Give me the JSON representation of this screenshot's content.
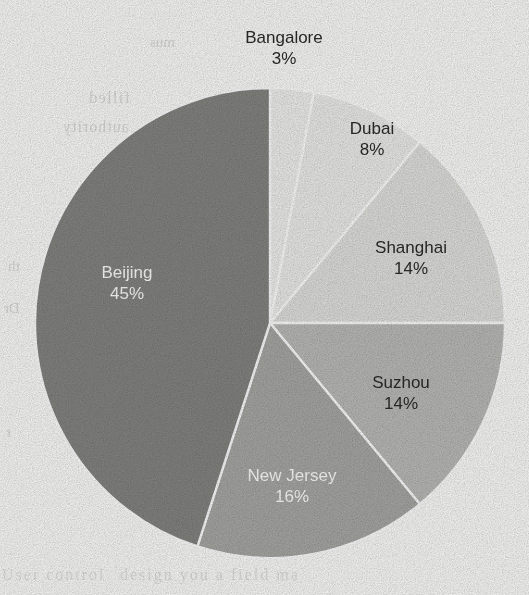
{
  "figure": {
    "background_color": "#fdfdfc",
    "stroke_color": "#ffffff"
  },
  "chart_data": {
    "type": "pie",
    "title": "",
    "subtitle": "",
    "xlabel": "",
    "ylabel": "",
    "legend_position": "none",
    "grid": false,
    "start_angle_deg": 0,
    "direction": "clockwise",
    "units": "percent",
    "categories": [
      "Bangalore",
      "Dubai",
      "Shanghai",
      "Suzhou",
      "New Jersey",
      "Beijing"
    ],
    "values": [
      3,
      8,
      14,
      14,
      16,
      45
    ],
    "labels": [
      "3%",
      "8%",
      "14%",
      "14%",
      "16%",
      "45%"
    ],
    "colors": [
      "#f1f1ef",
      "#eeeeec",
      "#e2e2df",
      "#bcbcb9",
      "#a9a9a6",
      "#858582"
    ],
    "slices": [
      {
        "name": "Bangalore",
        "value": 3,
        "label": "3%",
        "color": "#f1f1ef",
        "start_deg": 0,
        "end_deg": 10.8,
        "label_color": "#2b2b2b",
        "label_placement": "outside",
        "label_x": 284,
        "label_y": 40
      },
      {
        "name": "Dubai",
        "value": 8,
        "label": "8%",
        "color": "#eeeeec",
        "start_deg": 10.8,
        "end_deg": 39.6,
        "label_color": "#2b2b2b",
        "label_placement": "inside",
        "label_x": 372,
        "label_y": 131
      },
      {
        "name": "Shanghai",
        "value": 14,
        "label": "14%",
        "color": "#e2e2df",
        "start_deg": 39.6,
        "end_deg": 90.0,
        "label_color": "#2b2b2b",
        "label_placement": "inside",
        "label_x": 411,
        "label_y": 250
      },
      {
        "name": "Suzhou",
        "value": 14,
        "label": "14%",
        "color": "#bcbcb9",
        "start_deg": 90.0,
        "end_deg": 140.4,
        "label_color": "#2b2b2b",
        "label_placement": "inside",
        "label_x": 401,
        "label_y": 385
      },
      {
        "name": "New Jersey",
        "value": 16,
        "label": "16%",
        "color": "#a9a9a6",
        "start_deg": 140.4,
        "end_deg": 198.0,
        "label_color": "#ffffff",
        "label_placement": "inside",
        "label_x": 292,
        "label_y": 478
      },
      {
        "name": "Beijing",
        "value": 45,
        "label": "45%",
        "color": "#858582",
        "start_deg": 198.0,
        "end_deg": 360.0,
        "label_color": "#ffffff",
        "label_placement": "inside",
        "label_x": 127,
        "label_y": 275
      }
    ],
    "geometry": {
      "center_x": 270,
      "center_y": 323,
      "radius": 235
    }
  },
  "scan_artifacts": {
    "description": "faint mirrored bleed-through text from the reverse side of the scanned page",
    "ghost_text": [
      "filled",
      "authority",
      "th",
      "Dr",
      "r",
      "mus",
      "design you a field ma",
      "User control"
    ]
  }
}
